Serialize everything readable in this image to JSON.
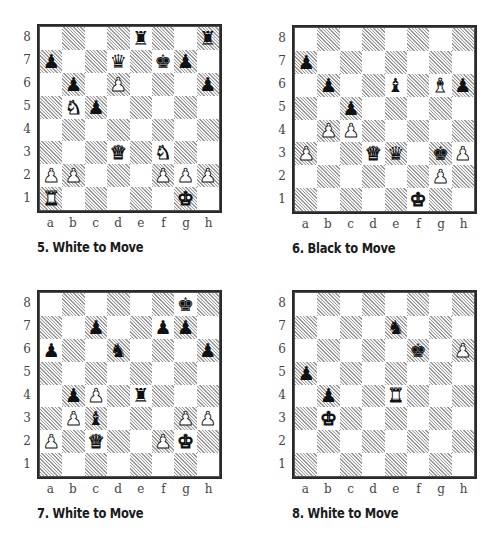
{
  "files": [
    "a",
    "b",
    "c",
    "d",
    "e",
    "f",
    "g",
    "h"
  ],
  "ranks": [
    "8",
    "7",
    "6",
    "5",
    "4",
    "3",
    "2",
    "1"
  ],
  "glyphs": {
    "K": "♚",
    "Q": "♛",
    "R": "♜",
    "B": "♝",
    "N": "♞",
    "P": "♟"
  },
  "diagrams": [
    {
      "number": 5,
      "caption": "5. White to Move",
      "side_to_move": "White",
      "pieces": {
        "e8": "bR",
        "h8": "bR",
        "a7": "bP",
        "d7": "bQ",
        "f7": "bK",
        "g7": "bP",
        "b6": "bP",
        "d6": "wP",
        "h6": "bP",
        "b5": "wN",
        "c5": "bP",
        "d3": "wQ",
        "f3": "wN",
        "a2": "wP",
        "b2": "wP",
        "f2": "wP",
        "g2": "wP",
        "h2": "wP",
        "a1": "wR",
        "g1": "wK"
      }
    },
    {
      "number": 6,
      "caption": "6. Black to Move",
      "side_to_move": "Black",
      "pieces": {
        "a7": "bP",
        "b6": "bP",
        "e6": "bB",
        "g6": "wB",
        "h6": "bP",
        "c5": "bP",
        "b4": "wP",
        "c4": "wP",
        "a3": "wP",
        "d3": "wQ",
        "e3": "bQ",
        "g3": "bK",
        "h3": "wP",
        "g2": "wP",
        "f1": "wK"
      }
    },
    {
      "number": 7,
      "caption": "7. White to Move",
      "side_to_move": "White",
      "pieces": {
        "g8": "bK",
        "c7": "bP",
        "f7": "bP",
        "g7": "bP",
        "a6": "bP",
        "d6": "bN",
        "h6": "bP",
        "b4": "bP",
        "c4": "wP",
        "e4": "bR",
        "b3": "wP",
        "c3": "bB",
        "g3": "wP",
        "h3": "wP",
        "a2": "wP",
        "c2": "wQ",
        "f2": "wP",
        "g2": "wK"
      }
    },
    {
      "number": 8,
      "caption": "8. White to Move",
      "side_to_move": "White",
      "pieces": {
        "e7": "bN",
        "f6": "bK",
        "h6": "wP",
        "a5": "bP",
        "b4": "bP",
        "e4": "wR",
        "b3": "wK"
      }
    }
  ]
}
